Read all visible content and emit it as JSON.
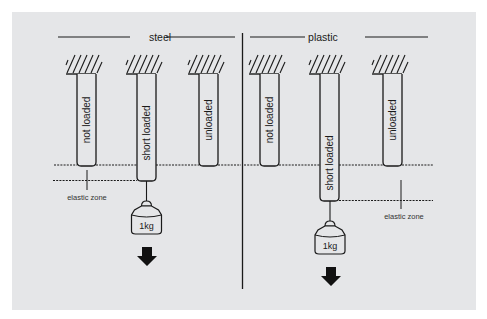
{
  "diagram": {
    "colors": {
      "background": "#e5e6e8",
      "stroke": "#1a1a1a"
    },
    "sections": [
      {
        "title": "steel",
        "rods": [
          {
            "label": "not loaded",
            "state": "not-loaded"
          },
          {
            "label": "short loaded",
            "state": "short-loaded"
          },
          {
            "label": "unloaded",
            "state": "unloaded"
          }
        ],
        "weight_label": "1kg",
        "zone_label": "elastic zone"
      },
      {
        "title": "plastic",
        "rods": [
          {
            "label": "not loaded",
            "state": "not-loaded"
          },
          {
            "label": "short loaded",
            "state": "short-loaded"
          },
          {
            "label": "unloaded",
            "state": "unloaded"
          }
        ],
        "weight_label": "1kg",
        "zone_label": "elastic zone"
      }
    ]
  }
}
